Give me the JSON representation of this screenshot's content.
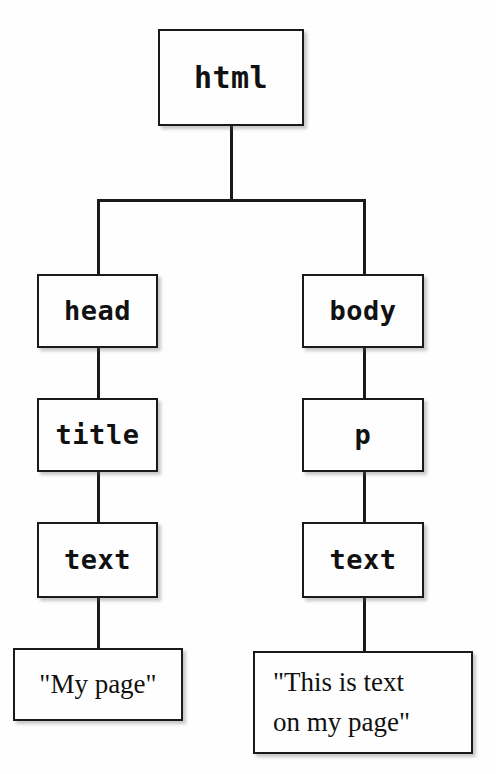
{
  "diagram": {
    "type": "tree",
    "nodes": [
      {
        "id": "html",
        "label": "html",
        "kind": "tag"
      },
      {
        "id": "head",
        "label": "head",
        "kind": "tag"
      },
      {
        "id": "body",
        "label": "body",
        "kind": "tag"
      },
      {
        "id": "title",
        "label": "title",
        "kind": "tag"
      },
      {
        "id": "p",
        "label": "p",
        "kind": "tag"
      },
      {
        "id": "text_left",
        "label": "text",
        "kind": "tag"
      },
      {
        "id": "text_right",
        "label": "text",
        "kind": "tag"
      },
      {
        "id": "mypage",
        "label": "\"My page\"",
        "kind": "literal"
      },
      {
        "id": "thistext",
        "label": "\"This is text\non my page\"",
        "kind": "literal"
      }
    ],
    "edges": [
      {
        "from": "html",
        "to": "head"
      },
      {
        "from": "html",
        "to": "body"
      },
      {
        "from": "head",
        "to": "title"
      },
      {
        "from": "body",
        "to": "p"
      },
      {
        "from": "title",
        "to": "text_left"
      },
      {
        "from": "p",
        "to": "text_right"
      },
      {
        "from": "text_left",
        "to": "mypage"
      },
      {
        "from": "text_right",
        "to": "thistext"
      }
    ],
    "colors": {
      "background": "#fdfdfd",
      "node_fill": "#fefefe",
      "stroke": "#1a1a1a",
      "text": "#111111"
    }
  }
}
